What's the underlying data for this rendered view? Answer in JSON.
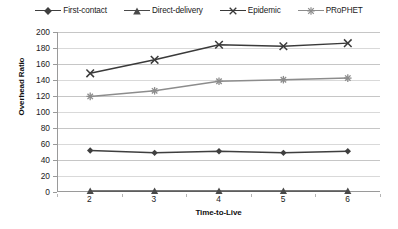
{
  "chart_data": {
    "type": "line",
    "title": "",
    "xlabel": "Time-to-Live",
    "ylabel": "Overhead Ratio",
    "x": [
      2,
      3,
      4,
      5,
      6
    ],
    "xtick_labels": [
      "2",
      "3",
      "4",
      "5",
      "6"
    ],
    "ytick_labels": [
      "0",
      "20",
      "40",
      "60",
      "80",
      "100",
      "120",
      "140",
      "160",
      "180",
      "200"
    ],
    "ytick_values": [
      0,
      20,
      40,
      60,
      80,
      100,
      120,
      140,
      160,
      180,
      200
    ],
    "ylim": [
      0,
      200
    ],
    "xlim": [
      2,
      6
    ],
    "grid": "horizontal",
    "legend_position": "top-center",
    "series": [
      {
        "name": "First-contact",
        "values": [
          51,
          48,
          50,
          48,
          50
        ],
        "marker": "diamond",
        "color": "#3f3f3f"
      },
      {
        "name": "Direct-delivery",
        "values": [
          0,
          0,
          0,
          0,
          0
        ],
        "marker": "triangle",
        "color": "#4a4a4a"
      },
      {
        "name": "Epidemic",
        "values": [
          148,
          165,
          184,
          182,
          186
        ],
        "marker": "cross",
        "color": "#3a3a3a"
      },
      {
        "name": "PRoPHET",
        "values": [
          119,
          126,
          138,
          140,
          142
        ],
        "marker": "asterisk",
        "color": "#8c8c8c"
      }
    ]
  },
  "legend": {
    "items": [
      {
        "label": "First-contact"
      },
      {
        "label": "Direct-delivery"
      },
      {
        "label": "Epidemic"
      },
      {
        "label": "PRoPHET"
      }
    ]
  },
  "axes": {
    "y_title": "Overhead Ratio",
    "x_title": "Time-to-Live"
  },
  "colors": {
    "background": "#ffffff",
    "grid": "#d9d9d9",
    "axis": "#9a9a9a",
    "text": "#1a1a1a"
  }
}
